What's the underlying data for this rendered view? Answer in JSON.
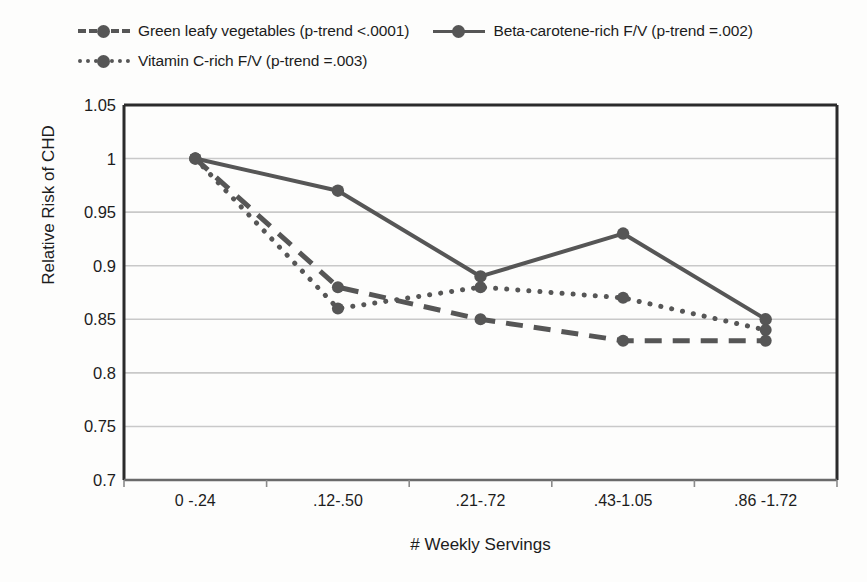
{
  "chart_data": {
    "type": "line",
    "title": "",
    "xlabel": "# Weekly Servings",
    "ylabel": "Relative Risk of CHD",
    "categories": [
      "0 -.24",
      ".12-.50",
      ".21-.72",
      ".43-1.05",
      ".86 -1.72"
    ],
    "ylim": [
      0.7,
      1.05
    ],
    "yticks": [
      "0.7",
      "0.75",
      "0.8",
      "0.85",
      "0.9",
      "0.95",
      "1",
      "1.05"
    ],
    "ytick_values": [
      0.7,
      0.75,
      0.8,
      0.85,
      0.9,
      0.95,
      1.0,
      1.05
    ],
    "grid": true,
    "legend_position": "top",
    "series": [
      {
        "name": "Green leafy vegetables (p-trend <.0001)",
        "style": "dashed",
        "color": "#565656",
        "values": [
          1.0,
          0.88,
          0.85,
          0.83,
          0.83
        ]
      },
      {
        "name": "Beta-carotene-rich F/V (p-trend =.002)",
        "style": "solid",
        "color": "#565656",
        "values": [
          1.0,
          0.97,
          0.89,
          0.93,
          0.85
        ]
      },
      {
        "name": "Vitamin C-rich F/V (p-trend =.003)",
        "style": "dotted",
        "color": "#565656",
        "values": [
          1.0,
          0.86,
          0.88,
          0.87,
          0.84
        ]
      }
    ]
  },
  "legend": {
    "rows": [
      [
        {
          "label": "Green leafy vegetables (p-trend <.0001)",
          "style": "dashed"
        },
        {
          "label": "Beta-carotene-rich F/V (p-trend =.002)",
          "style": "solid"
        }
      ],
      [
        {
          "label": "Vitamin C-rich F/V (p-trend =.003)",
          "style": "dotted"
        }
      ]
    ]
  }
}
